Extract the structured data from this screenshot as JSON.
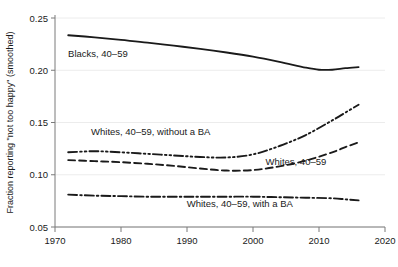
{
  "chart_data": {
    "type": "line",
    "title": "",
    "xlabel": "",
    "ylabel": "Fraction reporting \"not too happy\" (smoothed)",
    "xlim": [
      1970,
      2020
    ],
    "ylim": [
      0.05,
      0.25
    ],
    "xticks": [
      "1970",
      "1980",
      "1990",
      "2000",
      "2010",
      "2020"
    ],
    "xtick_values": [
      1970,
      1980,
      1990,
      2000,
      2010,
      2020
    ],
    "yticks": [
      "0.05",
      "0.10",
      "0.15",
      "0.20",
      "0.25"
    ],
    "ytick_values": [
      0.05,
      0.1,
      0.15,
      0.2,
      0.25
    ],
    "grid": "horizontal-light",
    "legend": "inline-annotations",
    "series": [
      {
        "name": "Blacks, 40–59",
        "label": "Blacks, 40–59",
        "style": "solid",
        "color": "#1a1a1a",
        "x": [
          1972,
          1976,
          1980,
          1984,
          1988,
          1992,
          1996,
          2000,
          2004,
          2008,
          2010,
          2012,
          2014,
          2016
        ],
        "values": [
          0.2335,
          0.2315,
          0.229,
          0.2265,
          0.2235,
          0.2205,
          0.217,
          0.213,
          0.208,
          0.2025,
          0.2005,
          0.2005,
          0.202,
          0.203
        ],
        "label_x": 1976.5,
        "label_y": 0.2125
      },
      {
        "name": "Whites, 40–59, without a BA",
        "label": "Whites, 40–59, without a BA",
        "style": "dash-dot-dot",
        "color": "#1a1a1a",
        "x": [
          1972,
          1976,
          1980,
          1984,
          1988,
          1992,
          1996,
          2000,
          2004,
          2008,
          2012,
          2014,
          2016
        ],
        "values": [
          0.1215,
          0.1225,
          0.1215,
          0.12,
          0.1185,
          0.117,
          0.1165,
          0.1195,
          0.1275,
          0.138,
          0.152,
          0.1595,
          0.167
        ],
        "label_x": 1984.5,
        "label_y": 0.1385
      },
      {
        "name": "Whites, 40–59",
        "label": "Whites, 40–59",
        "style": "dashed",
        "color": "#1a1a1a",
        "x": [
          1972,
          1976,
          1980,
          1984,
          1988,
          1992,
          1996,
          2000,
          2004,
          2008,
          2012,
          2014,
          2016
        ],
        "values": [
          0.114,
          0.113,
          0.112,
          0.1105,
          0.1085,
          0.106,
          0.104,
          0.1045,
          0.108,
          0.1135,
          0.1215,
          0.1265,
          0.131
        ],
        "label_x": 2006.5,
        "label_y": 0.1095
      },
      {
        "name": "Whites, 40–59, with a BA",
        "label": "Whites, 40–59, with a BA",
        "style": "dash-dot",
        "color": "#1a1a1a",
        "x": [
          1972,
          1976,
          1980,
          1984,
          1988,
          1992,
          1996,
          2000,
          2004,
          2008,
          2012,
          2014,
          2016
        ],
        "values": [
          0.081,
          0.08,
          0.0795,
          0.079,
          0.079,
          0.079,
          0.079,
          0.079,
          0.0785,
          0.078,
          0.0775,
          0.0765,
          0.0755
        ],
        "label_x": 1998.0,
        "label_y": 0.0695
      }
    ]
  }
}
